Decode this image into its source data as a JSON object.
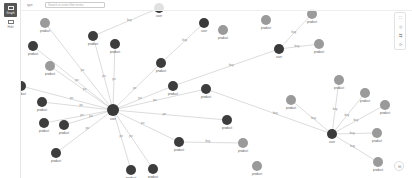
{
  "left_rail": {
    "graph_button": {
      "label": "Graph",
      "icon": "graph-icon"
    },
    "table_button": {
      "label": "Hide",
      "icon": "table-icon"
    }
  },
  "header": {
    "type_label": "type",
    "search_placeholder": "Search or enter filter terms"
  },
  "right_tools": [
    {
      "icon": "fit-icon",
      "glyph": "⛶"
    },
    {
      "icon": "focus-icon",
      "glyph": "◎"
    },
    {
      "icon": "layout-icon",
      "glyph": "⇆"
    },
    {
      "icon": "reset-icon",
      "glyph": "⟳"
    }
  ],
  "corner_button": {
    "icon": "settings-icon",
    "glyph": "⊞"
  },
  "colors": {
    "user_node": "#3a3a3a",
    "product_dark": "#3d3d3d",
    "product_gray": "#9a9a9a",
    "edge": "#c4c4c4"
  },
  "graph": {
    "nodes": [
      {
        "id": "hub",
        "label": "user",
        "x": 92,
        "y": 110,
        "r": 6,
        "kind": "dark"
      },
      {
        "id": "u2",
        "label": "user",
        "x": 258,
        "y": 49,
        "r": 5,
        "kind": "dark"
      },
      {
        "id": "u3",
        "label": "user",
        "x": 311,
        "y": 134,
        "r": 5,
        "kind": "dark"
      },
      {
        "id": "u4",
        "label": "user",
        "x": 183,
        "y": 23,
        "r": 5,
        "kind": "dark"
      },
      {
        "id": "u5",
        "label": "user",
        "x": 138,
        "y": 8,
        "r": 5,
        "kind": "dark"
      },
      {
        "id": "p1",
        "label": "product",
        "x": 24,
        "y": 23,
        "r": 5,
        "kind": "gray"
      },
      {
        "id": "p2",
        "label": "product",
        "x": 72,
        "y": 36,
        "r": 5,
        "kind": "dark"
      },
      {
        "id": "p3",
        "label": "product",
        "x": 94,
        "y": 44,
        "r": 5,
        "kind": "dark"
      },
      {
        "id": "p4",
        "label": "product",
        "x": 12,
        "y": 46,
        "r": 5,
        "kind": "dark"
      },
      {
        "id": "p5",
        "label": "product",
        "x": 29,
        "y": 66,
        "r": 5,
        "kind": "gray"
      },
      {
        "id": "p6",
        "label": "product",
        "x": 0,
        "y": 86,
        "r": 5,
        "kind": "dark"
      },
      {
        "id": "p7",
        "label": "product",
        "x": 21,
        "y": 102,
        "r": 5,
        "kind": "dark"
      },
      {
        "id": "p8",
        "label": "product",
        "x": 23,
        "y": 123,
        "r": 5,
        "kind": "dark"
      },
      {
        "id": "p9",
        "label": "product",
        "x": 43,
        "y": 125,
        "r": 5,
        "kind": "dark"
      },
      {
        "id": "p10",
        "label": "product",
        "x": 35,
        "y": 153,
        "r": 5,
        "kind": "dark"
      },
      {
        "id": "p11",
        "label": "product",
        "x": 140,
        "y": 63,
        "r": 5,
        "kind": "dark"
      },
      {
        "id": "p12",
        "label": "product",
        "x": 152,
        "y": 86,
        "r": 5,
        "kind": "dark"
      },
      {
        "id": "p13",
        "label": "product",
        "x": 185,
        "y": 89,
        "r": 5,
        "kind": "dark"
      },
      {
        "id": "p14",
        "label": "product",
        "x": 206,
        "y": 120,
        "r": 5,
        "kind": "dark"
      },
      {
        "id": "p15",
        "label": "product",
        "x": 158,
        "y": 142,
        "r": 5,
        "kind": "dark"
      },
      {
        "id": "p16",
        "label": "product",
        "x": 202,
        "y": 30,
        "r": 5,
        "kind": "gray"
      },
      {
        "id": "p17",
        "label": "product",
        "x": 222,
        "y": 143,
        "r": 5,
        "kind": "gray"
      },
      {
        "id": "p18",
        "label": "product",
        "x": 236,
        "y": 166,
        "r": 5,
        "kind": "gray"
      },
      {
        "id": "p19",
        "label": "product",
        "x": 132,
        "y": 169,
        "r": 5,
        "kind": "dark"
      },
      {
        "id": "p20",
        "label": "product",
        "x": 110,
        "y": 170,
        "r": 5,
        "kind": "dark"
      },
      {
        "id": "p21",
        "label": "product",
        "x": 291,
        "y": 14,
        "r": 5,
        "kind": "gray"
      },
      {
        "id": "p22",
        "label": "product",
        "x": 298,
        "y": 44,
        "r": 5,
        "kind": "gray"
      },
      {
        "id": "p23",
        "label": "product",
        "x": 245,
        "y": 20,
        "r": 5,
        "kind": "gray"
      },
      {
        "id": "p24",
        "label": "product",
        "x": 270,
        "y": 100,
        "r": 5,
        "kind": "gray"
      },
      {
        "id": "p25",
        "label": "product",
        "x": 318,
        "y": 80,
        "r": 5,
        "kind": "gray"
      },
      {
        "id": "p26",
        "label": "product",
        "x": 344,
        "y": 93,
        "r": 5,
        "kind": "gray"
      },
      {
        "id": "p27",
        "label": "product",
        "x": 364,
        "y": 105,
        "r": 5,
        "kind": "gray"
      },
      {
        "id": "p28",
        "label": "product",
        "x": 356,
        "y": 133,
        "r": 5,
        "kind": "gray"
      },
      {
        "id": "p29",
        "label": "product",
        "x": 357,
        "y": 162,
        "r": 5,
        "kind": "gray"
      }
    ],
    "edges": [
      {
        "from": "hub",
        "to": "p2",
        "label": "po"
      },
      {
        "from": "hub",
        "to": "p3",
        "label": "po"
      },
      {
        "from": "hub",
        "to": "p4",
        "label": "po"
      },
      {
        "from": "hub",
        "to": "p5",
        "label": "po"
      },
      {
        "from": "hub",
        "to": "p6",
        "label": "po"
      },
      {
        "from": "hub",
        "to": "p7",
        "label": "po"
      },
      {
        "from": "hub",
        "to": "p8",
        "label": "po"
      },
      {
        "from": "hub",
        "to": "p9",
        "label": "po"
      },
      {
        "from": "hub",
        "to": "p10",
        "label": "po"
      },
      {
        "from": "hub",
        "to": "p11",
        "label": "po"
      },
      {
        "from": "hub",
        "to": "p12",
        "label": "po"
      },
      {
        "from": "hub",
        "to": "p13",
        "label": "po"
      },
      {
        "from": "hub",
        "to": "p14",
        "label": "po"
      },
      {
        "from": "hub",
        "to": "p15",
        "label": "po"
      },
      {
        "from": "hub",
        "to": "p19",
        "label": "po"
      },
      {
        "from": "hub",
        "to": "p20",
        "label": "po"
      },
      {
        "from": "hub",
        "to": "p1",
        "label": "po"
      },
      {
        "from": "u2",
        "to": "p21",
        "label": "buy"
      },
      {
        "from": "u2",
        "to": "p22",
        "label": "buy"
      },
      {
        "from": "u2",
        "to": "p12",
        "label": "buy"
      },
      {
        "from": "u4",
        "to": "p11",
        "label": "buy"
      },
      {
        "from": "u5",
        "to": "p2",
        "label": "buy"
      },
      {
        "from": "u3",
        "to": "p25",
        "label": "buy"
      },
      {
        "from": "u3",
        "to": "p26",
        "label": "buy"
      },
      {
        "from": "u3",
        "to": "p27",
        "label": "buy"
      },
      {
        "from": "u3",
        "to": "p28",
        "label": "buy"
      },
      {
        "from": "u3",
        "to": "p29",
        "label": "buy"
      },
      {
        "from": "u3",
        "to": "p24",
        "label": "buy"
      },
      {
        "from": "u3",
        "to": "p13",
        "label": "buy"
      },
      {
        "from": "p15",
        "to": "p17",
        "label": "buy"
      }
    ]
  }
}
